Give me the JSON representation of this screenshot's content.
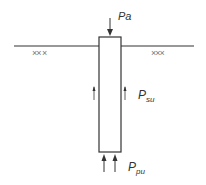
{
  "diagram": {
    "colors": {
      "line": "#333333",
      "soil_hatch": "#777777",
      "background": "#ffffff"
    },
    "ground_line": {
      "x1": 14,
      "x2": 194,
      "y": 46
    },
    "pile": {
      "x": 99,
      "y": 37,
      "width": 22,
      "height": 115
    },
    "soil_marks": {
      "left": "××  ×",
      "right": "×××"
    },
    "loads": {
      "applied": {
        "label": "Pa",
        "direction": "down"
      },
      "shaft_friction": {
        "label_main": "P",
        "label_sub": "su",
        "direction": "up"
      },
      "point_bearing": {
        "label_main": "P",
        "label_sub": "pu",
        "direction": "up"
      }
    }
  }
}
